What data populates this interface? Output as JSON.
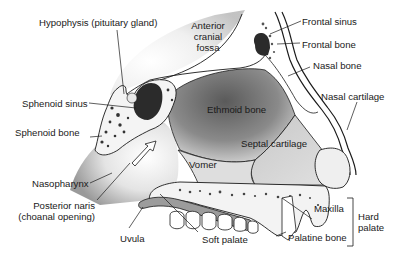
{
  "diagram": {
    "labels": {
      "hypophysis": "Hypophysis (pituitary gland)",
      "anterior_cranial_fossa": [
        "Anterior",
        "cranial",
        "fossa"
      ],
      "frontal_sinus": "Frontal sinus",
      "frontal_bone": "Frontal bone",
      "nasal_bone": "Nasal bone",
      "nasal_cartilage": "Nasal  cartilage",
      "sphenoid_sinus": "Sphenoid sinus",
      "sphenoid_bone": "Sphenoid bone",
      "ethmoid_bone": "Ethmoid bone",
      "septal_cartilage": "Septal  cartilage",
      "vomer": "Vomer",
      "nasopharynx": "Nasopharynx",
      "posterior_naris": [
        "Posterior naris",
        "(choanal opening)"
      ],
      "uvula": "Uvula",
      "soft_palate": "Soft palate",
      "maxilla": "Maxilla",
      "palatine_bone": "Palatine bone",
      "hard_palate": [
        "Hard",
        "palate"
      ]
    },
    "colors": {
      "line": "#1a1a1a",
      "dark_cavity": "#2b2b2b",
      "shade": "#8c8c8c",
      "light_shade": "#d9d9d9",
      "bone_fill": "#f2f2f2",
      "background": "#ffffff"
    }
  }
}
